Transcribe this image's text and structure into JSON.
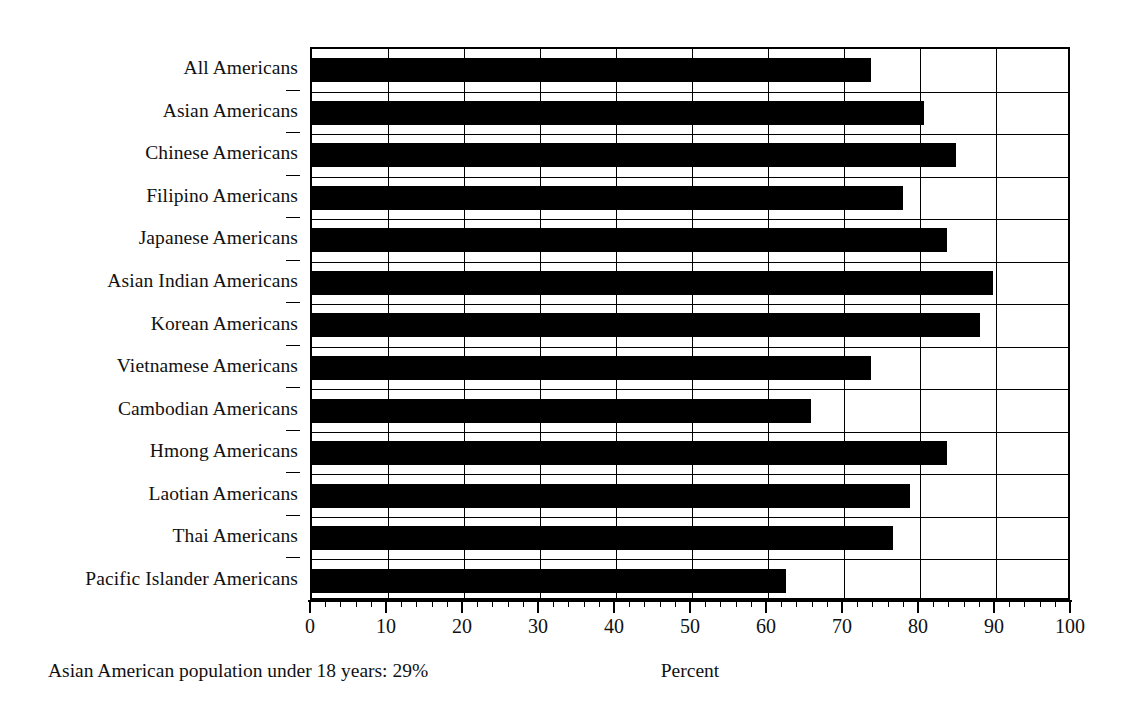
{
  "chart_data": {
    "type": "bar",
    "orientation": "horizontal",
    "title": "",
    "subtitle": "",
    "xlabel": "Percent",
    "ylabel": "",
    "xlim": [
      0,
      100
    ],
    "grid": true,
    "legend": null,
    "categories": [
      "All Americans",
      "Asian Americans",
      "Chinese Americans",
      "Filipino Americans",
      "Japanese Americans",
      "Asian Indian Americans",
      "Korean Americans",
      "Vietnamese Americans",
      "Cambodian Americans",
      "Hmong Americans",
      "Laotian Americans",
      "Thai Americans",
      "Pacific Islander Americans"
    ],
    "values": [
      73.6,
      80.5,
      84.8,
      77.7,
      83.6,
      89.6,
      87.9,
      73.5,
      65.6,
      83.5,
      78.7,
      76.5,
      62.4
    ],
    "bar_color": "#000000",
    "xticks": [
      0,
      10,
      20,
      30,
      40,
      50,
      60,
      70,
      80,
      90,
      100
    ],
    "xtick_labels": [
      "0",
      "10",
      "20",
      "30",
      "40",
      "50",
      "60",
      "70",
      "80",
      "90",
      "100"
    ],
    "minor_ticks_per_interval": 5,
    "annotation": "Asian American population under 18 years: 29%"
  },
  "footnote": {
    "text": "Asian American population under 18 years: 29%"
  },
  "axis": {
    "x_title": "Percent"
  }
}
